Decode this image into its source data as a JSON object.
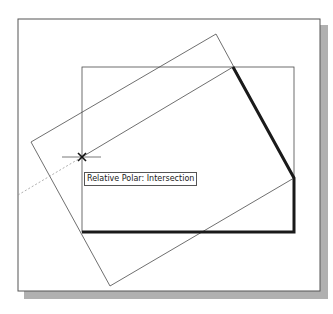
{
  "drawing": {
    "tooltip_text": "Relative Polar: Intersection",
    "colors": {
      "background": "#ffffff",
      "frame": "#555555",
      "shadow": "#a8a8a8",
      "thin_line": "#4a4a4a",
      "heavy_line": "#1a1a1a",
      "dashed_line": "#9a9a9a"
    },
    "frame": {
      "x": 18,
      "y": 19,
      "width": 302,
      "height": 272
    },
    "inner_rectangle": {
      "x": 82,
      "y": 67,
      "width": 212,
      "height": 165
    },
    "rotated_rectangle": [
      [
        216,
        34
      ],
      [
        294,
        178
      ],
      [
        110,
        286
      ],
      [
        31,
        142
      ]
    ],
    "heavy_polyline": [
      [
        233,
        67
      ],
      [
        294,
        178
      ],
      [
        294,
        232
      ],
      [
        82,
        232
      ]
    ],
    "diagonal_line": [
      [
        82,
        157
      ],
      [
        233,
        67
      ]
    ],
    "tracking_line_dashed": [
      [
        18,
        195
      ],
      [
        82,
        157
      ]
    ],
    "snap_marker": {
      "x": 82,
      "y": 157,
      "type": "intersection"
    }
  }
}
